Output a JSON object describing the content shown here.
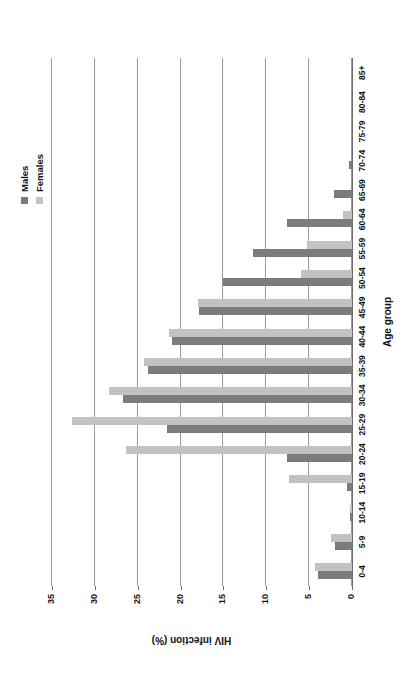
{
  "chart_data": {
    "type": "bar",
    "title": "",
    "xlabel": "Age group",
    "ylabel": "HIV infection (%)",
    "ylim": [
      0,
      35
    ],
    "yticks": [
      0,
      5,
      10,
      15,
      20,
      25,
      30,
      35
    ],
    "grid": true,
    "legend_position": "top-right",
    "orientation": "vertical-grouped",
    "categories": [
      "0-4",
      "5-9",
      "10-14",
      "15-19",
      "20-24",
      "25-29",
      "30-34",
      "35-39",
      "40-44",
      "45-49",
      "50-54",
      "55-59",
      "60-64",
      "65-69",
      "70-74",
      "75-79",
      "80-84",
      "85+"
    ],
    "series": [
      {
        "name": "Males",
        "color": "#7b7b7b",
        "values": [
          4.0,
          2.0,
          0.2,
          0.6,
          7.6,
          21.6,
          26.7,
          23.8,
          21.0,
          17.8,
          15.0,
          11.6,
          7.6,
          2.1,
          0.3,
          0.0,
          0.0,
          0.0
        ]
      },
      {
        "name": "Females",
        "color": "#c2c2c2",
        "values": [
          4.3,
          2.5,
          0.2,
          7.4,
          26.4,
          32.7,
          28.4,
          24.3,
          21.3,
          18.0,
          5.9,
          5.3,
          1.1,
          0.0,
          0.0,
          0.0,
          0.0,
          0.0
        ]
      }
    ]
  },
  "legend": {
    "items": [
      {
        "label": "Males",
        "color": "#7b7b7b"
      },
      {
        "label": "Females",
        "color": "#c2c2c2"
      }
    ]
  },
  "axes": {
    "x_title": "Age group",
    "y_title": "HIV infection (%)",
    "y_ticks": [
      "0",
      "5",
      "10",
      "15",
      "20",
      "25",
      "30",
      "35"
    ],
    "x_ticks": [
      "0-4",
      "5-9",
      "10-14",
      "15-19",
      "20-24",
      "25-29",
      "30-34",
      "35-39",
      "40-44",
      "45-49",
      "50-54",
      "55-59",
      "60-64",
      "65-69",
      "70-74",
      "75-79",
      "80-84",
      "85+"
    ]
  },
  "colors": {
    "male_bar": "#7b7b7b",
    "female_bar": "#c2c2c2",
    "gridline": "#9a9a9a",
    "axis": "#6e6e6e",
    "background": "#ffffff",
    "text": "#111111"
  }
}
